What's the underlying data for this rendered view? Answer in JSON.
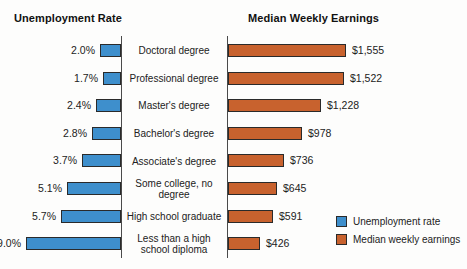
{
  "chart_data": {
    "type": "bar",
    "orientation": "horizontal",
    "layout": "butterfly-paired-bars",
    "grid": false,
    "legend_position": "bottom-right",
    "categories": [
      "Doctoral degree",
      "Professional degree",
      "Master's degree",
      "Bachelor's degree",
      "Associate's degree",
      "Some college, no degree",
      "High school graduate",
      "Less than a high school diploma"
    ],
    "series": [
      {
        "name": "Unemployment rate",
        "title": "Unemployment Rate",
        "unit": "%",
        "color": "#3e8fcc",
        "direction": "left",
        "values": [
          2.0,
          1.7,
          2.4,
          2.8,
          3.7,
          5.1,
          5.7,
          9.0
        ],
        "labels": [
          "2.0%",
          "1.7%",
          "2.4%",
          "2.8%",
          "3.7%",
          "5.1%",
          "5.7%",
          "9.0%"
        ],
        "axis_max": 9.6
      },
      {
        "name": "Median weekly earnings",
        "title": "Median Weekly Earnings",
        "unit": "$",
        "color": "#c8622e",
        "direction": "right",
        "values": [
          1555,
          1522,
          1228,
          978,
          736,
          645,
          591,
          426
        ],
        "labels": [
          "$1,555",
          "$1,522",
          "$1,228",
          "$978",
          "$736",
          "$645",
          "$591",
          "$426"
        ],
        "axis_max": 1660
      }
    ]
  },
  "titles": {
    "left": "Unemployment Rate",
    "right": "Median Weekly Earnings"
  },
  "legend": {
    "items": [
      {
        "label": "Unemployment rate",
        "color": "#3e8fcc"
      },
      {
        "label": "Median weekly earnings",
        "color": "#c8622e"
      }
    ]
  },
  "colors": {
    "blue": "#3e8fcc",
    "orange": "#c8622e",
    "outline": "#2a2a2a",
    "background": "#fdfdfc",
    "text": "#222222"
  }
}
